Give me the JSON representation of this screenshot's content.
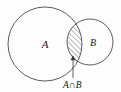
{
  "figure": {
    "kind": "venn-diagram",
    "background_color": "#fdfdfd",
    "stroke_color": "#4a4a4a",
    "text_color": "#1a1a1a",
    "hatch_color": "#4a4a4a"
  },
  "sets": {
    "a": {
      "label": "A",
      "center_x": 45,
      "center_y": 44,
      "radius": 37
    },
    "b": {
      "label": "B",
      "center_x": 90,
      "center_y": 42,
      "radius": 23
    }
  },
  "intersection": {
    "label": "A∩B",
    "fill_style": "diagonal-hatch",
    "hatch_direction": "forward-slash",
    "hatch_spacing": 2.6
  },
  "annotation": {
    "leader_from_x": 73,
    "leader_from_y": 78,
    "leader_to_x": 73,
    "leader_to_y": 58,
    "caption_x": 63,
    "caption_y": 88
  }
}
